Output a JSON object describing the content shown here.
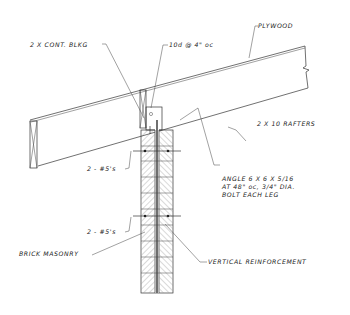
{
  "drawing": {
    "type": "roof-to-masonry-wall connection section detail",
    "labels": {
      "plywood": "PLYWOOD",
      "blocking": "2 X CONT. BLKG",
      "nailing": "10d @ 4\" oc",
      "rafters": "2 X 10 RAFTERS",
      "angle_line1": "ANGLE 6 X 6 X 5/16",
      "angle_line2": "AT 48\" oc, 3/4\" DIA.",
      "angle_line3": "BOLT EACH LEG",
      "rebar_upper": "2 - #5's",
      "rebar_lower": "2 - #5's",
      "brick": "BRICK MASONRY",
      "vertical_reinf": "VERTICAL REINFORCEMENT"
    },
    "colors": {
      "background": "#ffffff",
      "line": "#333333",
      "text": "#222222"
    }
  }
}
